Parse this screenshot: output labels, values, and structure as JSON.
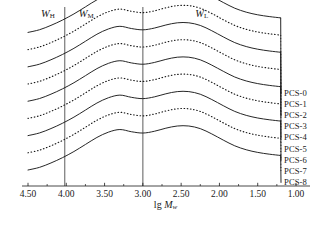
{
  "chart_data": {
    "type": "line",
    "title": "",
    "xlabel": "lg Mw",
    "xlabel_parts": {
      "prefix": "lg ",
      "italic": "M",
      "subscript": "w"
    },
    "ylabel": "",
    "xlim": [
      4.5,
      1.0
    ],
    "x_reversed": true,
    "xticks": [
      4.5,
      4.0,
      3.5,
      3.0,
      2.5,
      2.0,
      1.5,
      1.0
    ],
    "xtick_labels": [
      "4.50",
      "4.00",
      "3.50",
      "3.00",
      "2.50",
      "2.00",
      "1.50",
      "1.00"
    ],
    "grid": false,
    "legend_position": "right-inline",
    "annotations": [
      {
        "name": "W_H",
        "text": "W",
        "subscript": "H",
        "x": 4.24,
        "y_top": 0.955
      },
      {
        "name": "W_M",
        "text": "W",
        "subscript": "M",
        "x": 3.74,
        "y_top": 0.955
      },
      {
        "name": "W_L",
        "text": "W",
        "subscript": "L",
        "x": 2.23,
        "y_top": 0.955
      }
    ],
    "divider_lines": [
      {
        "name": "divider-high-mid",
        "x": 4.02
      },
      {
        "name": "divider-mid-low",
        "x": 3.0
      }
    ],
    "series": [
      {
        "name": "PCS-0",
        "label": "PCS-0",
        "style": "solid",
        "offset": 8,
        "x": [
          4.5,
          4.35,
          4.2,
          4.05,
          3.9,
          3.75,
          3.6,
          3.45,
          3.3,
          3.15,
          3.0,
          2.85,
          2.7,
          2.55,
          2.4,
          2.25,
          2.1,
          1.95,
          1.8,
          1.65,
          1.5,
          1.35,
          1.2
        ],
        "values": [
          0.0,
          0.06,
          0.16,
          0.28,
          0.42,
          0.58,
          0.74,
          0.86,
          0.92,
          0.87,
          0.84,
          0.88,
          0.95,
          1.0,
          1.0,
          0.94,
          0.82,
          0.68,
          0.55,
          0.46,
          0.4,
          0.36,
          0.33
        ]
      },
      {
        "name": "PCS-1",
        "label": "PCS-1",
        "style": "dotted",
        "offset": 7,
        "x": [
          4.5,
          4.35,
          4.2,
          4.05,
          3.9,
          3.75,
          3.6,
          3.45,
          3.3,
          3.15,
          3.0,
          2.85,
          2.7,
          2.55,
          2.4,
          2.25,
          2.1,
          1.95,
          1.8,
          1.65,
          1.5,
          1.35,
          1.2
        ],
        "values": [
          0.0,
          0.06,
          0.16,
          0.28,
          0.42,
          0.58,
          0.74,
          0.86,
          0.92,
          0.87,
          0.84,
          0.88,
          0.95,
          1.0,
          1.0,
          0.94,
          0.82,
          0.68,
          0.55,
          0.46,
          0.4,
          0.36,
          0.33
        ]
      },
      {
        "name": "PCS-2",
        "label": "PCS-2",
        "style": "solid",
        "offset": 6,
        "x": [
          4.5,
          4.35,
          4.2,
          4.05,
          3.9,
          3.75,
          3.6,
          3.45,
          3.3,
          3.15,
          3.0,
          2.85,
          2.7,
          2.55,
          2.4,
          2.25,
          2.1,
          1.95,
          1.8,
          1.65,
          1.5,
          1.35,
          1.2
        ],
        "values": [
          0.0,
          0.06,
          0.16,
          0.28,
          0.42,
          0.58,
          0.74,
          0.86,
          0.92,
          0.87,
          0.84,
          0.88,
          0.95,
          1.0,
          1.0,
          0.94,
          0.82,
          0.68,
          0.55,
          0.46,
          0.4,
          0.36,
          0.33
        ]
      },
      {
        "name": "PCS-3",
        "label": "PCS-3",
        "style": "dotted",
        "offset": 5,
        "x": [
          4.5,
          4.35,
          4.2,
          4.05,
          3.9,
          3.75,
          3.6,
          3.45,
          3.3,
          3.15,
          3.0,
          2.85,
          2.7,
          2.55,
          2.4,
          2.25,
          2.1,
          1.95,
          1.8,
          1.65,
          1.5,
          1.35,
          1.2
        ],
        "values": [
          0.0,
          0.06,
          0.16,
          0.28,
          0.42,
          0.58,
          0.74,
          0.86,
          0.92,
          0.87,
          0.84,
          0.88,
          0.95,
          1.0,
          1.0,
          0.94,
          0.82,
          0.68,
          0.55,
          0.46,
          0.4,
          0.36,
          0.33
        ]
      },
      {
        "name": "PCS-4",
        "label": "PCS-4",
        "style": "solid",
        "offset": 4,
        "x": [
          4.5,
          4.35,
          4.2,
          4.05,
          3.9,
          3.75,
          3.6,
          3.45,
          3.3,
          3.15,
          3.0,
          2.85,
          2.7,
          2.55,
          2.4,
          2.25,
          2.1,
          1.95,
          1.8,
          1.65,
          1.5,
          1.35,
          1.2
        ],
        "values": [
          0.0,
          0.06,
          0.16,
          0.28,
          0.42,
          0.58,
          0.74,
          0.86,
          0.92,
          0.87,
          0.84,
          0.88,
          0.95,
          1.0,
          1.0,
          0.94,
          0.82,
          0.68,
          0.55,
          0.46,
          0.4,
          0.36,
          0.33
        ]
      },
      {
        "name": "PCS-5",
        "label": "PCS-5",
        "style": "dotted",
        "offset": 3,
        "x": [
          4.5,
          4.35,
          4.2,
          4.05,
          3.9,
          3.75,
          3.6,
          3.45,
          3.3,
          3.15,
          3.0,
          2.85,
          2.7,
          2.55,
          2.4,
          2.25,
          2.1,
          1.95,
          1.8,
          1.65,
          1.5,
          1.35,
          1.2
        ],
        "values": [
          0.0,
          0.06,
          0.16,
          0.28,
          0.42,
          0.58,
          0.74,
          0.86,
          0.92,
          0.87,
          0.84,
          0.88,
          0.95,
          1.0,
          1.0,
          0.94,
          0.82,
          0.68,
          0.55,
          0.46,
          0.4,
          0.36,
          0.33
        ]
      },
      {
        "name": "PCS-6",
        "label": "PCS-6",
        "style": "solid",
        "offset": 2,
        "x": [
          4.5,
          4.35,
          4.2,
          4.05,
          3.9,
          3.75,
          3.6,
          3.45,
          3.3,
          3.15,
          3.0,
          2.85,
          2.7,
          2.55,
          2.4,
          2.25,
          2.1,
          1.95,
          1.8,
          1.65,
          1.5,
          1.35,
          1.2
        ],
        "values": [
          0.0,
          0.06,
          0.16,
          0.28,
          0.42,
          0.58,
          0.74,
          0.86,
          0.92,
          0.87,
          0.84,
          0.88,
          0.95,
          1.0,
          1.0,
          0.94,
          0.82,
          0.68,
          0.55,
          0.46,
          0.4,
          0.36,
          0.33
        ]
      },
      {
        "name": "PCS-7",
        "label": "PCS-7",
        "style": "dotted",
        "offset": 1,
        "x": [
          4.5,
          4.35,
          4.2,
          4.05,
          3.9,
          3.75,
          3.6,
          3.45,
          3.3,
          3.15,
          3.0,
          2.85,
          2.7,
          2.55,
          2.4,
          2.25,
          2.1,
          1.95,
          1.8,
          1.65,
          1.5,
          1.35,
          1.2
        ],
        "values": [
          0.0,
          0.06,
          0.16,
          0.28,
          0.42,
          0.58,
          0.74,
          0.86,
          0.92,
          0.87,
          0.84,
          0.88,
          0.95,
          1.0,
          1.0,
          0.94,
          0.82,
          0.68,
          0.55,
          0.46,
          0.4,
          0.36,
          0.33
        ]
      },
      {
        "name": "PCS-8",
        "label": "PCS-8",
        "style": "solid",
        "offset": 0,
        "x": [
          4.5,
          4.35,
          4.2,
          4.05,
          3.9,
          3.75,
          3.6,
          3.45,
          3.3,
          3.15,
          3.0,
          2.85,
          2.7,
          2.55,
          2.4,
          2.25,
          2.1,
          1.95,
          1.8,
          1.65,
          1.5,
          1.35,
          1.2
        ],
        "values": [
          0.0,
          0.06,
          0.16,
          0.28,
          0.42,
          0.58,
          0.74,
          0.86,
          0.92,
          0.87,
          0.84,
          0.88,
          0.95,
          1.0,
          1.0,
          0.94,
          0.82,
          0.68,
          0.55,
          0.46,
          0.4,
          0.36,
          0.33
        ]
      }
    ],
    "colors": {
      "curve": "#1a1a1a",
      "axis": "#1a1a1a",
      "divider": "#6b6b6b",
      "text": "#1a1a1a",
      "background": "#ffffff"
    }
  }
}
